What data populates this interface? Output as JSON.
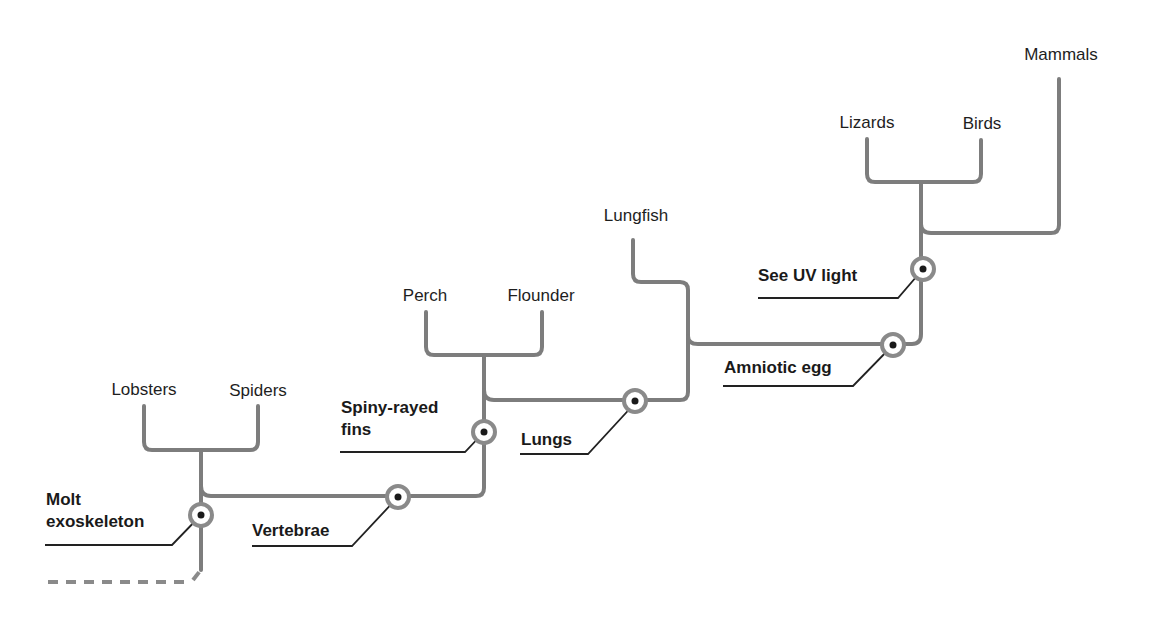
{
  "diagram": {
    "type": "cladogram",
    "taxa": [
      {
        "name": "Lobsters"
      },
      {
        "name": "Spiders"
      },
      {
        "name": "Perch"
      },
      {
        "name": "Flounder"
      },
      {
        "name": "Lungfish"
      },
      {
        "name": "Lizards"
      },
      {
        "name": "Birds"
      },
      {
        "name": "Mammals"
      }
    ],
    "traits": [
      {
        "name": "Molt exoskeleton",
        "line1": "Molt",
        "line2": "exoskeleton"
      },
      {
        "name": "Vertebrae",
        "line1": "Vertebrae"
      },
      {
        "name": "Spiny-rayed fins",
        "line1": "Spiny-rayed",
        "line2": "fins"
      },
      {
        "name": "Lungs",
        "line1": "Lungs"
      },
      {
        "name": "Amniotic egg",
        "line1": "Amniotic egg"
      },
      {
        "name": "See UV light",
        "line1": "See UV light"
      }
    ],
    "colors": {
      "branch": "#7d7d7d",
      "text": "#1e1e1e",
      "node_dot": "#1a1a1a"
    }
  }
}
